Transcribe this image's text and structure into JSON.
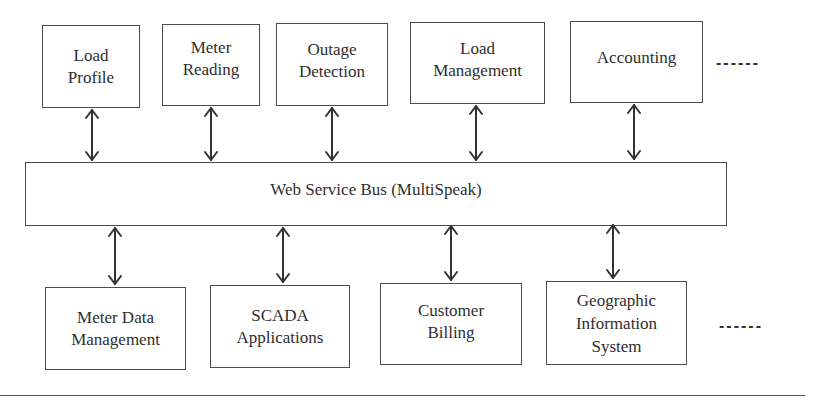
{
  "diagram": {
    "top_row": [
      {
        "id": "load-profile",
        "label": "Load\nProfile"
      },
      {
        "id": "meter-reading",
        "label": "Meter\nReading"
      },
      {
        "id": "outage-detection",
        "label": "Outage\nDetection"
      },
      {
        "id": "load-management",
        "label": "Load\nManagement"
      },
      {
        "id": "accounting",
        "label": "Accounting"
      }
    ],
    "top_continuation": "------",
    "bus": {
      "label": "Web Service Bus (MultiSpeak)"
    },
    "bottom_row": [
      {
        "id": "meter-data-management",
        "label": "Meter Data\nManagement"
      },
      {
        "id": "scada-applications",
        "label": "SCADA\nApplications"
      },
      {
        "id": "customer-billing",
        "label": "Customer\nBilling"
      },
      {
        "id": "geographic-information-system",
        "label": "Geographic\nInformation\nSystem"
      }
    ],
    "bottom_continuation": "------",
    "connections": "bidirectional arrows between each application box and the bus",
    "colors": {
      "line": "#4a4a4a",
      "text": "#2e2e2e",
      "background": "#ffffff"
    }
  }
}
